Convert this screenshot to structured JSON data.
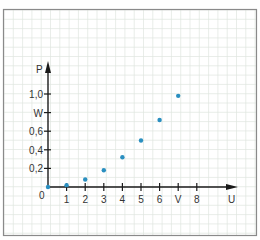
{
  "chart_data": {
    "type": "scatter",
    "title": "",
    "xlabel": "U",
    "ylabel": "P",
    "origin_label": "0",
    "x_ticks": [
      {
        "value": 1,
        "label": "1"
      },
      {
        "value": 2,
        "label": "2"
      },
      {
        "value": 3,
        "label": "3"
      },
      {
        "value": 4,
        "label": "4"
      },
      {
        "value": 5,
        "label": "5"
      },
      {
        "value": 6,
        "label": "6"
      },
      {
        "value": 7,
        "label": "V"
      },
      {
        "value": 8,
        "label": "8"
      }
    ],
    "y_ticks": [
      {
        "value": 0.2,
        "label": "0,2"
      },
      {
        "value": 0.4,
        "label": "0,4"
      },
      {
        "value": 0.6,
        "label": "0,6"
      },
      {
        "value": 0.8,
        "label": "W"
      },
      {
        "value": 1.0,
        "label": "1,0"
      }
    ],
    "x": [
      0,
      1,
      2,
      3,
      4,
      5,
      6,
      7
    ],
    "values": [
      0,
      0.02,
      0.08,
      0.18,
      0.32,
      0.5,
      0.72,
      0.98
    ],
    "xlim": [
      0,
      10
    ],
    "ylim": [
      0,
      1.3
    ],
    "grid": true,
    "legend": null,
    "colors": {
      "points": "#2a8fc0",
      "axes": "#1a1a1a",
      "grid": "#dfe5df",
      "frame": "#8a8a8a"
    }
  }
}
